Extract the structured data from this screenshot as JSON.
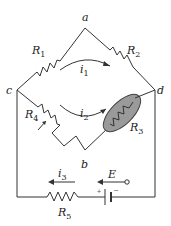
{
  "diagram": {
    "type": "circuit-bridge",
    "nodes": {
      "a": "a",
      "b": "b",
      "c": "c",
      "d": "d"
    },
    "resistors": {
      "R1": {
        "name": "R",
        "sub": "1"
      },
      "R2": {
        "name": "R",
        "sub": "2"
      },
      "R3": {
        "name": "R",
        "sub": "3"
      },
      "R4": {
        "name": "R",
        "sub": "4"
      },
      "R5": {
        "name": "R",
        "sub": "5"
      }
    },
    "currents": {
      "i1": {
        "name": "i",
        "sub": "1"
      },
      "i2": {
        "name": "i",
        "sub": "2"
      },
      "i3": {
        "name": "i",
        "sub": "3"
      }
    },
    "source": {
      "emf": "E",
      "plus": "+",
      "minus": "−"
    },
    "colors": {
      "wire": "#333333",
      "r3_fill": "#9a9a9a",
      "text": "#222222"
    }
  }
}
